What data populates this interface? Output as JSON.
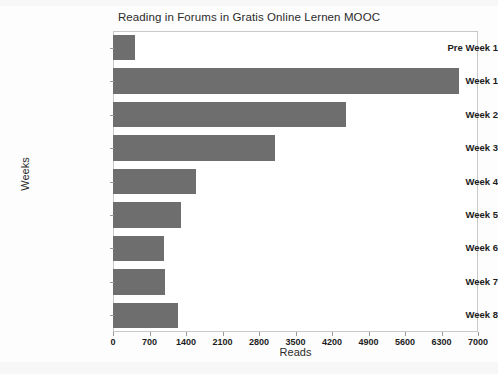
{
  "chart_data": {
    "type": "bar",
    "orientation": "horizontal",
    "title": "Reading in Forums in Gratis Online Lernen MOOC",
    "xlabel": "Reads",
    "ylabel": "Weeks",
    "categories": [
      "Pre Week 1",
      "Week 1",
      "Week 2",
      "Week 3",
      "Week 4",
      "Week 5",
      "Week 6",
      "Week 7",
      "Week 8"
    ],
    "values": [
      420,
      6640,
      4470,
      3110,
      1600,
      1300,
      980,
      1000,
      1240
    ],
    "xlim": [
      0,
      7000
    ],
    "xticks": [
      0,
      700,
      1400,
      2100,
      2800,
      3500,
      4200,
      4900,
      5600,
      6300,
      7000
    ],
    "xtick_labels": [
      "0",
      "700",
      "1400",
      "2100",
      "2800",
      "3500",
      "4200",
      "4900",
      "5600",
      "6300",
      "7000"
    ],
    "grid": false,
    "legend": null,
    "bar_color": "#6e6e6e",
    "frame_color": "#c9c9c9",
    "background_color": "#ffffff"
  }
}
